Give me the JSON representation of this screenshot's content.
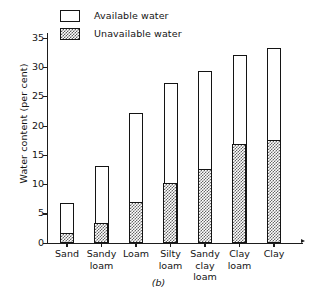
{
  "caption": "(b)",
  "legend": {
    "position": "top-left",
    "items": [
      {
        "label": "Available water",
        "swatch": "white-box",
        "color": "#ffffff"
      },
      {
        "label": "Unavailable water",
        "swatch": "stipple-box",
        "color": "#666666"
      }
    ]
  },
  "chart_data": {
    "type": "bar",
    "title": "",
    "subtitle": "",
    "xlabel": "",
    "ylabel": "Water content (per cent)",
    "ylim": [
      0,
      35
    ],
    "yticks": [
      0,
      5,
      10,
      15,
      20,
      25,
      30,
      35
    ],
    "ytick_labels": [
      "0",
      "5",
      "10",
      "15",
      "20",
      "25",
      "30",
      "35"
    ],
    "grid": false,
    "stacked": true,
    "legend_position": "top-left",
    "categories": [
      "Sand",
      "Sandy loam",
      "Loam",
      "Silty loam",
      "Sandy clay loam",
      "Clay loam",
      "Clay"
    ],
    "category_lines": [
      [
        "Sand"
      ],
      [
        "Sandy",
        "loam"
      ],
      [
        "Loam"
      ],
      [
        "Silty",
        "loam"
      ],
      [
        "Sandy",
        "clay",
        "loam"
      ],
      [
        "Clay",
        "loam"
      ],
      [
        "Clay"
      ]
    ],
    "series": [
      {
        "name": "Unavailable water",
        "values": [
          1.8,
          3.5,
          7.0,
          10.3,
          12.6,
          16.9,
          17.6
        ]
      },
      {
        "name": "Available water",
        "values": [
          5.0,
          9.6,
          15.2,
          17.0,
          16.8,
          15.1,
          15.6
        ]
      }
    ],
    "totals": [
      6.8,
      13.1,
      22.2,
      27.3,
      29.4,
      32.0,
      33.2
    ]
  }
}
